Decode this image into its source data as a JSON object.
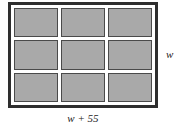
{
  "figure": {
    "frame": {
      "border_color": "#2e2e2e",
      "fill_color": "#ffffff"
    },
    "panel": {
      "fill_color": "#a9a9a9",
      "border_color": "#4a4a4a",
      "rows": 3,
      "columns": 3,
      "count": 9
    },
    "labels": {
      "height": "w",
      "width": "w + 55"
    }
  },
  "chart_data": {
    "type": "diagram",
    "shape": "rectangle",
    "grid": {
      "rows": 3,
      "columns": 3,
      "cells": 9
    },
    "dimensions": [
      {
        "side": "right",
        "orientation": "vertical",
        "label": "w"
      },
      {
        "side": "bottom",
        "orientation": "horizontal",
        "label": "w + 55"
      }
    ],
    "annotations": [
      "w",
      "w + 55"
    ]
  }
}
